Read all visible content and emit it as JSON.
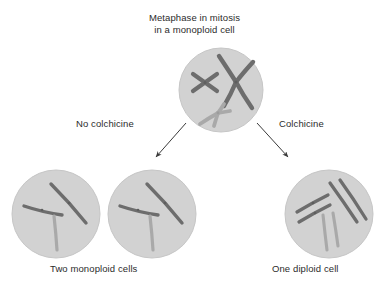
{
  "title": {
    "line1": "Metaphase in mitosis",
    "line2": "in a monoploid cell"
  },
  "labels": {
    "no_colchicine": "No colchicine",
    "colchicine": "Colchicine"
  },
  "captions": {
    "left": "Two monoploid cells",
    "right": "One diploid cell"
  },
  "colors": {
    "background": "#ffffff",
    "cell_fill": "#d2d2d2",
    "cell_edge": "#c4c4c4",
    "chromosome_dark": "#6d6d6d",
    "chromosome_light": "#a9a9a9",
    "text": "#2b2b2b",
    "arrow": "#3a3a3a"
  },
  "cells": [
    {
      "id": "metaphase-cell",
      "role": "parent monoploid cell at metaphase",
      "cx": 221,
      "cy": 90,
      "r": 42,
      "chromosome_count": 3,
      "chromosome_form": "replicated-x-shaped",
      "chromosomes": [
        {
          "name": "small-dark-x",
          "shade": "dark"
        },
        {
          "name": "large-dark-x",
          "shade": "dark"
        },
        {
          "name": "light-x",
          "shade": "light"
        }
      ]
    },
    {
      "id": "monoploid-cell-1",
      "role": "daughter monoploid cell",
      "cx": 56,
      "cy": 214,
      "r": 44,
      "chromosome_count": 3,
      "chromosome_form": "single",
      "chromosomes": [
        {
          "name": "short-dark-chromosome",
          "shade": "dark"
        },
        {
          "name": "long-dark-chromosome",
          "shade": "dark"
        },
        {
          "name": "light-chromosome",
          "shade": "light"
        }
      ]
    },
    {
      "id": "monoploid-cell-2",
      "role": "daughter monoploid cell",
      "cx": 152,
      "cy": 214,
      "r": 44,
      "chromosome_count": 3,
      "chromosome_form": "single",
      "chromosomes": [
        {
          "name": "short-dark-chromosome",
          "shade": "dark"
        },
        {
          "name": "long-dark-chromosome",
          "shade": "dark"
        },
        {
          "name": "light-chromosome",
          "shade": "light"
        }
      ]
    },
    {
      "id": "diploid-cell",
      "role": "single diploid cell after colchicine",
      "cx": 329,
      "cy": 214,
      "r": 44,
      "chromosome_count": 6,
      "chromosome_form": "single-paired",
      "chromosomes": [
        {
          "name": "short-dark-chromosome-a",
          "shade": "dark"
        },
        {
          "name": "short-dark-chromosome-b",
          "shade": "dark"
        },
        {
          "name": "long-dark-chromosome-a",
          "shade": "dark"
        },
        {
          "name": "long-dark-chromosome-b",
          "shade": "dark"
        },
        {
          "name": "light-chromosome-a",
          "shade": "light"
        },
        {
          "name": "light-chromosome-b",
          "shade": "light"
        }
      ]
    }
  ],
  "arrows": [
    {
      "name": "arrow-no-colchicine",
      "from": "metaphase-cell",
      "to": "monoploid-cell-2",
      "direction": "down-left"
    },
    {
      "name": "arrow-colchicine",
      "from": "metaphase-cell",
      "to": "diploid-cell",
      "direction": "down-right"
    }
  ]
}
